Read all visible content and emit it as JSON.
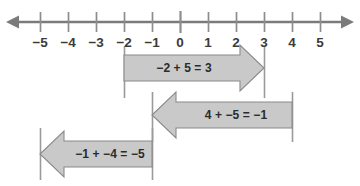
{
  "figure": {
    "type": "number-line-diagram",
    "title": "",
    "background_color": "#ffffff",
    "axis_color": "#7b7b7b",
    "tick_color": "#8d8d8d",
    "label_color": "#3b3b3b",
    "arrow_fill": "#c9c9c9",
    "arrow_stroke": "#8a8a8a",
    "guide_color": "#9a9a9a"
  },
  "number_line": {
    "name": "number-line",
    "min": -5,
    "max": 5,
    "zero_x": 180,
    "unit_px": 28,
    "left_arrow": "open",
    "right_arrow": "open",
    "ticks": [
      {
        "value": -5,
        "label": "−5"
      },
      {
        "value": -4,
        "label": "−4"
      },
      {
        "value": -3,
        "label": "−3"
      },
      {
        "value": -2,
        "label": "−2"
      },
      {
        "value": -1,
        "label": "−1"
      },
      {
        "value": 0,
        "label": "0"
      },
      {
        "value": 1,
        "label": "1"
      },
      {
        "value": 2,
        "label": "2"
      },
      {
        "value": 3,
        "label": "3"
      },
      {
        "value": 4,
        "label": "4"
      },
      {
        "value": 5,
        "label": "5"
      }
    ]
  },
  "jumps": [
    {
      "name": "jump-neg2-plus-5",
      "label": "−2 + 5 = 3",
      "start": -2,
      "end": 3,
      "direction": "right",
      "row_top": 55,
      "row_height": 26,
      "guides": [
        {
          "value": -2,
          "top": 46,
          "height": 52
        },
        {
          "value": 3,
          "top": 46,
          "height": 52
        }
      ]
    },
    {
      "name": "jump-4-plus-neg5",
      "label": "4 + −5 = −1",
      "start": 4,
      "end": -1,
      "direction": "left",
      "row_top": 102,
      "row_height": 26,
      "guides": [
        {
          "value": 4,
          "top": 92,
          "height": 50
        },
        {
          "value": -1,
          "top": 92,
          "height": 50
        }
      ]
    },
    {
      "name": "jump-neg1-plus-neg4",
      "label": "−1 + −4 = −5",
      "start": -1,
      "end": -5,
      "direction": "left",
      "row_top": 141,
      "row_height": 26,
      "guides": [
        {
          "value": -1,
          "top": 128,
          "height": 52
        },
        {
          "value": -5,
          "top": 128,
          "height": 52
        }
      ]
    }
  ]
}
